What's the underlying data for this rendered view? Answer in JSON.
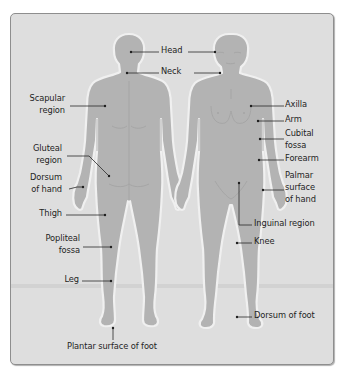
{
  "diagram": {
    "title": "",
    "colors": {
      "panel_bg": "#dedede",
      "panel_border": "#8e8e8e",
      "body_fill": "#b3b3b3",
      "body_outline": "#f2f2f2",
      "leader_line": "#2a2a2a",
      "label_text": "#1e1e1e"
    },
    "figures": [
      {
        "name": "posterior view",
        "side": "left"
      },
      {
        "name": "anterior view",
        "side": "right"
      }
    ],
    "labels": {
      "head": "Head",
      "neck": "Neck",
      "scapular_1": "Scapular",
      "scapular_2": "region",
      "gluteal_1": "Gluteal",
      "gluteal_2": "region",
      "dorsum_hand_1": "Dorsum",
      "dorsum_hand_2": "of hand",
      "thigh": "Thigh",
      "popliteal_1": "Popliteal",
      "popliteal_2": "fossa",
      "leg": "Leg",
      "plantar": "Plantar surface of foot",
      "axilla": "Axilla",
      "arm": "Arm",
      "cubital_1": "Cubital",
      "cubital_2": "fossa",
      "forearm": "Forearm",
      "palmar_1": "Palmar",
      "palmar_2": "surface",
      "palmar_3": "of hand",
      "inguinal": "Inguinal  region",
      "knee": "Knee",
      "dorsum_foot": "Dorsum of foot"
    }
  }
}
